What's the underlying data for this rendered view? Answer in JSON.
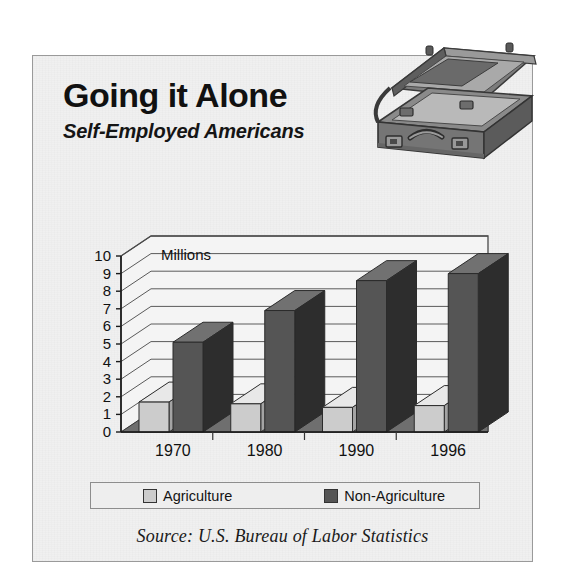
{
  "headline": {
    "title": "Going it Alone",
    "subtitle": "Self-Employed Americans"
  },
  "artwork": {
    "icon": "open-briefcase-illustration"
  },
  "legend": {
    "items": [
      {
        "label": "Agriculture",
        "color": "#cccccc"
      },
      {
        "label": "Non-Agriculture",
        "color": "#555555"
      }
    ]
  },
  "source": "Source:  U.S. Bureau of Labor Statistics",
  "chart_data": {
    "type": "bar",
    "title": "Going it Alone",
    "subtitle": "Self-Employed Americans",
    "unit_label": "Millions",
    "xlabel": "",
    "ylabel": "Millions",
    "ylim": [
      0,
      10
    ],
    "yticks": [
      0,
      1,
      2,
      3,
      4,
      5,
      6,
      7,
      8,
      9,
      10
    ],
    "grid": true,
    "legend_position": "bottom",
    "style": "3d-column",
    "categories": [
      "1970",
      "1980",
      "1990",
      "1996"
    ],
    "series": [
      {
        "name": "Agriculture",
        "color": "#cccccc",
        "values": [
          1.7,
          1.6,
          1.4,
          1.5
        ]
      },
      {
        "name": "Non-Agriculture",
        "color": "#555555",
        "values": [
          5.1,
          6.9,
          8.6,
          9.0
        ]
      }
    ],
    "source": "Source:  U.S. Bureau of Labor Statistics"
  }
}
